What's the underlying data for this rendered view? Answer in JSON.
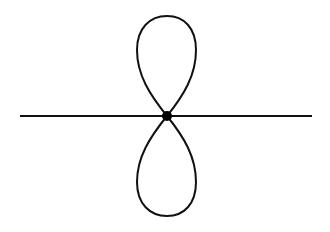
{
  "diagram": {
    "colors": {
      "background": "#ffffff",
      "stroke": "#111111",
      "node": "#000000"
    },
    "axis": {
      "x1": 20,
      "y1": 116,
      "x2": 312,
      "y2": 116,
      "stroke_width": 2
    },
    "node": {
      "cx": 167,
      "cy": 116,
      "r": 5
    },
    "lobes": [
      {
        "name": "upper-lobe",
        "path": "M167,116 C150,95 137,75 137,50 C137,28 150,16 167,16 C184,16 196,28 196,50 C196,75 184,95 167,116 Z"
      },
      {
        "name": "lower-lobe",
        "path": "M167,116 C150,137 137,157 137,182 C137,204 150,216 167,216 C184,216 196,204 196,182 C196,157 184,137 167,116 Z"
      }
    ],
    "lobe_stroke_width": 2
  }
}
